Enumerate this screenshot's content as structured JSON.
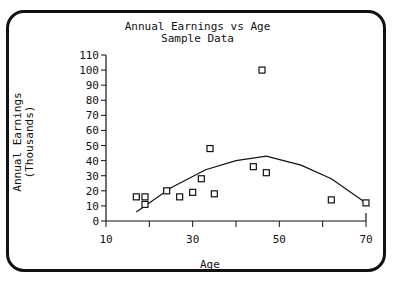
{
  "chart_data": {
    "type": "scatter",
    "title": "Annual Earnings vs Age",
    "subtitle": "Sample Data",
    "xlabel": "Age",
    "ylabel": "Annual Earnings\n(Thousands)",
    "ylabel_line1": "Annual Earnings",
    "ylabel_line2": "(Thousands)",
    "xlim": [
      10,
      70
    ],
    "ylim": [
      0,
      110
    ],
    "x_ticks": [
      10,
      20,
      30,
      40,
      50,
      60,
      70
    ],
    "x_tick_labels": [
      "10",
      "",
      "30",
      "",
      "50",
      "",
      "70"
    ],
    "y_ticks": [
      0,
      10,
      20,
      30,
      40,
      50,
      60,
      70,
      80,
      90,
      100,
      110
    ],
    "grid": false,
    "series": [
      {
        "name": "Observed",
        "marker": "square",
        "x": [
          17,
          19,
          19,
          24,
          27,
          30,
          32,
          34,
          35,
          44,
          46,
          47,
          62,
          70
        ],
        "y": [
          16,
          16,
          11,
          20,
          16,
          19,
          28,
          48,
          18,
          36,
          100,
          32,
          14,
          12
        ]
      },
      {
        "name": "Fitted",
        "type": "line",
        "x": [
          17,
          25,
          33,
          40,
          47,
          55,
          62,
          70
        ],
        "y": [
          6,
          22,
          34,
          40,
          43,
          37,
          28,
          12
        ]
      }
    ]
  }
}
